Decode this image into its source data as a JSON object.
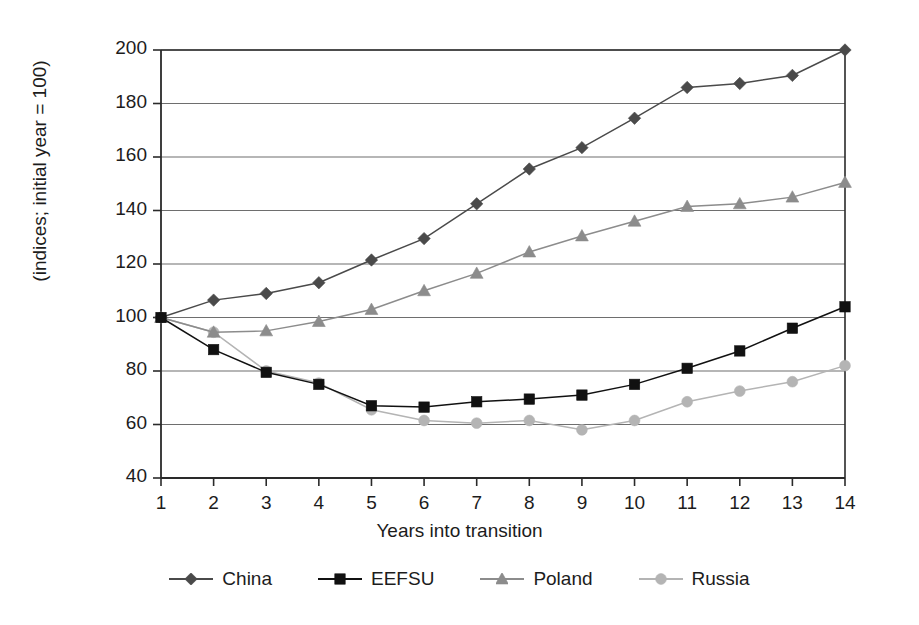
{
  "chart_data": {
    "type": "line",
    "title": "",
    "subtitle": "",
    "xlabel": "Years into transition",
    "ylabel": "(indices; initial year = 100)",
    "x": [
      1,
      2,
      3,
      4,
      5,
      6,
      7,
      8,
      9,
      10,
      11,
      12,
      13,
      14
    ],
    "xtick_labels": [
      "1",
      "2",
      "3",
      "4",
      "5",
      "6",
      "7",
      "8",
      "9",
      "10",
      "11",
      "12",
      "13",
      "14"
    ],
    "ytick_labels": [
      "40",
      "60",
      "80",
      "100",
      "120",
      "140",
      "160",
      "180",
      "200"
    ],
    "yticks": [
      40,
      60,
      80,
      100,
      120,
      140,
      160,
      180,
      200
    ],
    "xlim": [
      0.6,
      14.4
    ],
    "ylim": [
      40,
      200
    ],
    "grid": "horizontal",
    "legend_position": "bottom",
    "series": [
      {
        "name": "China",
        "marker": "diamond",
        "color": "#4a4a4a",
        "values": [
          100,
          106.5,
          109,
          113,
          121.5,
          129.5,
          142.5,
          155.5,
          163.5,
          174.5,
          186,
          187.5,
          190.5,
          200
        ]
      },
      {
        "name": "EEFSU",
        "marker": "square",
        "color": "#111111",
        "values": [
          100,
          88,
          79.5,
          75,
          67,
          66.5,
          68.5,
          69.5,
          71,
          75,
          81,
          87.5,
          96,
          104
        ]
      },
      {
        "name": "Poland",
        "marker": "triangle",
        "color": "#8c8c8c",
        "values": [
          100,
          94.5,
          95,
          98.5,
          103,
          110,
          116.5,
          124.5,
          130.5,
          136,
          141.5,
          142.5,
          145,
          150.5
        ]
      },
      {
        "name": "Russia",
        "marker": "circle",
        "color": "#b4b4b4",
        "values": [
          100,
          94.5,
          80,
          75.5,
          65.5,
          61.5,
          60.5,
          61.5,
          58,
          61.5,
          68.5,
          72.5,
          76,
          82
        ]
      }
    ]
  },
  "legend": {
    "items": [
      {
        "label": "China"
      },
      {
        "label": "EEFSU"
      },
      {
        "label": "Poland"
      },
      {
        "label": "Russia"
      }
    ]
  },
  "axes": {
    "y_title": "(indices; initial year = 100)",
    "x_title": "Years into transition"
  }
}
